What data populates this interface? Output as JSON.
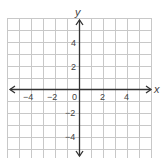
{
  "graph": {
    "axis_labels": {
      "x": "x",
      "y": "y"
    },
    "x_ticks": [
      {
        "value": -4,
        "label": "−4"
      },
      {
        "value": -2,
        "label": "−2"
      },
      {
        "value": 0,
        "label": "0"
      },
      {
        "value": 2,
        "label": "2"
      },
      {
        "value": 4,
        "label": "4"
      }
    ],
    "y_ticks": [
      {
        "value": 4,
        "label": "4"
      },
      {
        "value": 2,
        "label": "2"
      },
      {
        "value": -2,
        "label": "−2"
      },
      {
        "value": -4,
        "label": "−4"
      }
    ],
    "grid": {
      "xmin": -6,
      "xmax": 6,
      "ymin": -6,
      "ymax": 6
    },
    "colors": {
      "grid": "#c8c8c8",
      "axis": "#333333"
    }
  }
}
